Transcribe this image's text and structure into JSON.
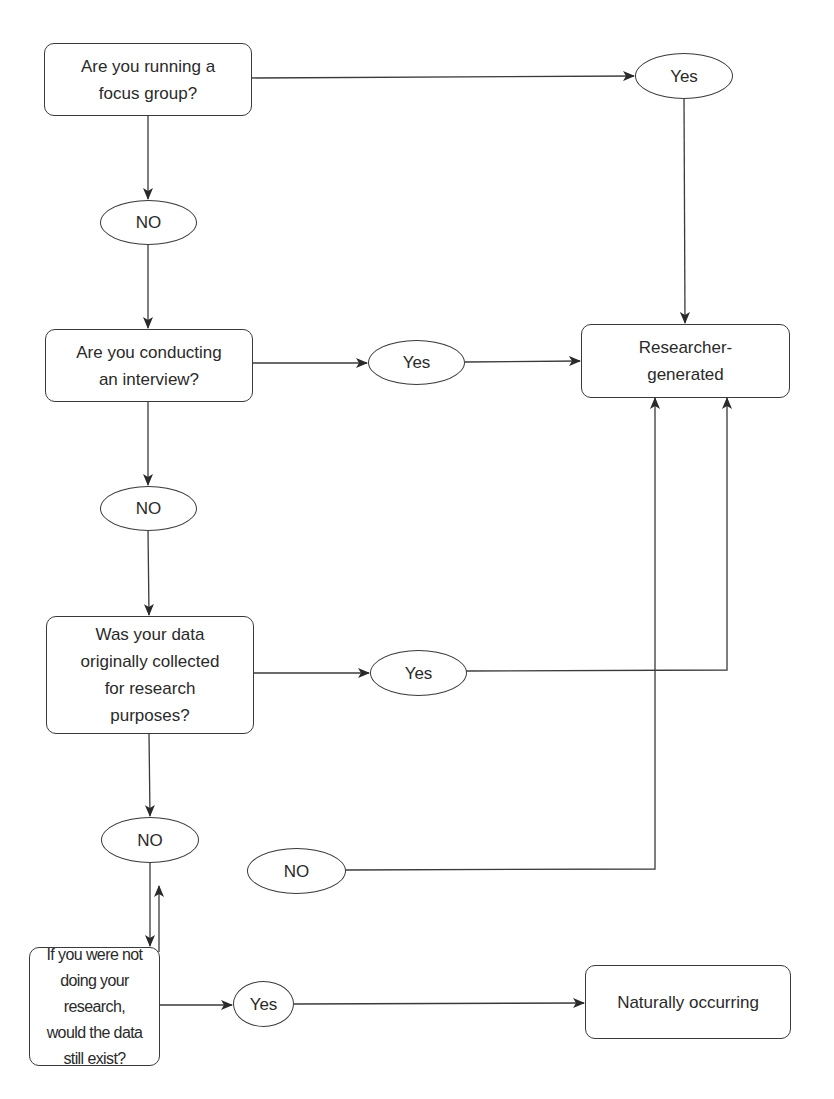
{
  "diagram": {
    "type": "flowchart",
    "colors": {
      "stroke": "#3a3a3a",
      "text": "#2a2a2a",
      "background": "#ffffff"
    },
    "nodes": {
      "q1": {
        "label": "Are you running a\nfocus group?",
        "shape": "rounded-rect"
      },
      "yes1": {
        "label": "Yes",
        "shape": "ellipse"
      },
      "no1": {
        "label": "NO",
        "shape": "ellipse"
      },
      "q2": {
        "label": "Are you conducting\nan interview?",
        "shape": "rounded-rect"
      },
      "yes2": {
        "label": "Yes",
        "shape": "ellipse"
      },
      "researcher": {
        "label": "Researcher-\ngenerated",
        "shape": "rounded-rect"
      },
      "no2": {
        "label": "NO",
        "shape": "ellipse"
      },
      "q3": {
        "label": "Was your data\noriginally collected\nfor research\npurposes?",
        "shape": "rounded-rect"
      },
      "yes3": {
        "label": "Yes",
        "shape": "ellipse"
      },
      "no3": {
        "label": "NO",
        "shape": "ellipse"
      },
      "no4": {
        "label": "NO",
        "shape": "ellipse"
      },
      "q4": {
        "label": "If you were not\ndoing your research,\nwould the data\nstill exist?",
        "shape": "rounded-rect"
      },
      "yes4": {
        "label": "Yes",
        "shape": "ellipse"
      },
      "natural": {
        "label": "Naturally occurring",
        "shape": "rounded-rect"
      }
    },
    "edges": [
      {
        "from": "q1",
        "to": "yes1"
      },
      {
        "from": "yes1",
        "to": "researcher"
      },
      {
        "from": "q1",
        "to": "no1"
      },
      {
        "from": "no1",
        "to": "q2"
      },
      {
        "from": "q2",
        "to": "yes2"
      },
      {
        "from": "yes2",
        "to": "researcher"
      },
      {
        "from": "q2",
        "to": "no2"
      },
      {
        "from": "no2",
        "to": "q3"
      },
      {
        "from": "q3",
        "to": "yes3"
      },
      {
        "from": "yes3",
        "to": "researcher"
      },
      {
        "from": "q3",
        "to": "no3"
      },
      {
        "from": "no3",
        "to": "q4"
      },
      {
        "from": "q4",
        "to": "no4"
      },
      {
        "from": "no4",
        "to": "researcher"
      },
      {
        "from": "q4",
        "to": "yes4"
      },
      {
        "from": "yes4",
        "to": "natural"
      }
    ]
  }
}
